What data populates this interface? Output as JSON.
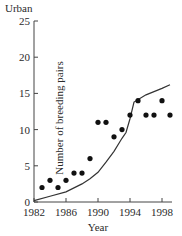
{
  "chart_data": {
    "type": "scatter",
    "title": "Urban",
    "xlabel": "Year",
    "ylabel": "Number of breeding pairs",
    "xlim": [
      1982,
      2000
    ],
    "ylim": [
      0,
      25
    ],
    "x_ticks": [
      1982,
      1986,
      1990,
      1994,
      1998
    ],
    "y_ticks": [
      0,
      5,
      10,
      15,
      20,
      25
    ],
    "grid": false,
    "legend": null,
    "series": [
      {
        "name": "Observed",
        "type": "scatter",
        "marker": "filled-circle",
        "color": "#111111",
        "x": [
          1983,
          1984,
          1985,
          1986,
          1987,
          1988,
          1989,
          1990,
          1991,
          1992,
          1993,
          1994,
          1995,
          1996,
          1997,
          1998,
          1999
        ],
        "y": [
          2,
          3,
          2,
          3,
          4,
          4,
          6,
          11,
          11,
          9,
          10,
          12,
          14,
          12,
          12,
          14,
          12
        ]
      },
      {
        "name": "Model",
        "type": "line",
        "color": "#333333",
        "x": [
          1982,
          1984,
          1986,
          1988,
          1989,
          1990,
          1991,
          1992,
          1993,
          1993.5,
          1994,
          1994.5,
          1996,
          1998,
          1999
        ],
        "y": [
          0.2,
          0.8,
          1.4,
          2.5,
          3.2,
          4.1,
          5.5,
          7.0,
          8.8,
          9.6,
          11.5,
          13.8,
          14.8,
          15.7,
          16.2
        ]
      }
    ]
  },
  "labels": {
    "title": "Urban",
    "xlabel": "Year",
    "ylabel": "Number of breeding pairs"
  }
}
